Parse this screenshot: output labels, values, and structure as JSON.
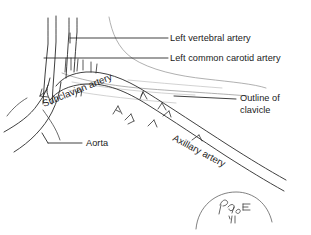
{
  "figure": {
    "background_color": "#ffffff",
    "ink_color": "#2a2a2a",
    "faint_ink_color": "#b4b4b4",
    "width": 311,
    "height": 235
  },
  "labels": {
    "vertebral": {
      "text": "Left vertebral artery",
      "x": 170,
      "y": 38
    },
    "carotid": {
      "text": "Left common carotid artery",
      "x": 170,
      "y": 58
    },
    "clavicle_line1": {
      "text": "Outline of",
      "x": 240,
      "y": 98
    },
    "clavicle_line2": {
      "text": "clavicle",
      "x": 240,
      "y": 110
    },
    "aorta": {
      "text": "Aorta",
      "x": 85,
      "y": 145
    },
    "subclavian": {
      "text": "Subclavian artery",
      "rotation_degrees": -22
    },
    "axillary": {
      "text": "Axillary artery",
      "rotation_degrees": 28
    }
  },
  "signature": {
    "monogram": "illegible handwritten artist monogram",
    "year_mark": "'81"
  }
}
